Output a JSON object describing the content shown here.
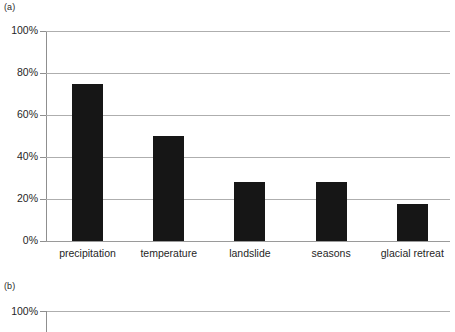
{
  "figure": {
    "panel_a_label": "(a)",
    "panel_b_label": "(b)"
  },
  "chart_data": [
    {
      "id": "panel-a",
      "type": "bar",
      "title": "",
      "xlabel": "",
      "ylabel": "",
      "categories": [
        "precipitation",
        "temperature",
        "landslide",
        "seasons",
        "glacial retreat"
      ],
      "values": [
        75,
        50,
        28,
        28,
        17.5
      ],
      "value_labels": [
        "75%",
        "50%",
        "28%",
        "28%",
        "17.5%"
      ],
      "ylim": [
        0,
        100
      ],
      "yticks": [
        0,
        20,
        40,
        60,
        80,
        100
      ],
      "ytick_labels": [
        "0%",
        "20%",
        "40%",
        "60%",
        "80%",
        "100%"
      ],
      "grid": true,
      "grid_axis": "y",
      "legend": false,
      "bar_color": "#161616",
      "grid_color": "#aeaeae",
      "axis_color": "#8f8f8f",
      "background": "#ffffff"
    },
    {
      "id": "panel-b",
      "type": "bar",
      "title": "",
      "note": "cropped at image bottom; only top gridline and 100% tick visible",
      "categories": [],
      "values": [],
      "ylim": [
        0,
        100
      ],
      "yticks": [
        100
      ],
      "ytick_labels": [
        "100%"
      ],
      "grid": true,
      "grid_axis": "y",
      "legend": false,
      "grid_color": "#aeaeae",
      "axis_color": "#8f8f8f",
      "background": "#ffffff"
    }
  ]
}
